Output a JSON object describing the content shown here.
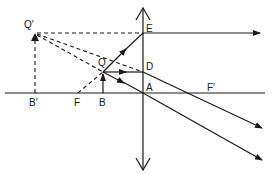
{
  "diagram": {
    "type": "convex-lens-ray-diagram",
    "ink_color": "#1a1a1a",
    "background": "#ffffff",
    "labels": {
      "Q_prime": "Q′",
      "B_prime": "B′",
      "F": "F",
      "B": "B",
      "Q": "Q",
      "E": "E",
      "D": "D",
      "A": "A",
      "F_prime": "F′"
    },
    "points": {
      "Q_prime": [
        35,
        33
      ],
      "B_prime": [
        35,
        93
      ],
      "F": [
        78,
        93
      ],
      "Q": [
        103,
        72
      ],
      "B": [
        103,
        93
      ],
      "E": [
        143,
        33
      ],
      "D": [
        143,
        72
      ],
      "A": [
        143,
        93
      ],
      "F_prime": [
        210,
        93
      ]
    }
  }
}
